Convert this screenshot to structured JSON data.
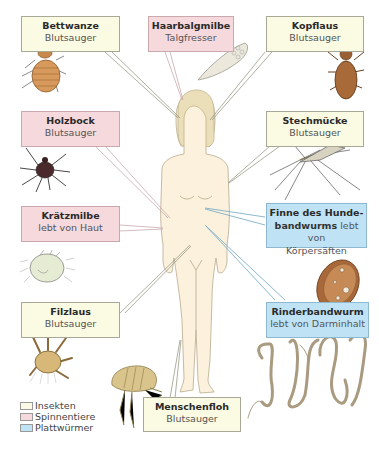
{
  "diagram": {
    "category_colors": {
      "insekten": "#fbfae2",
      "spinnentiere": "#f6d9dd",
      "plattwuermer": "#bfe3f5"
    },
    "parasites": [
      {
        "id": "bettwanze",
        "name": "Bettwanze",
        "role": "Blutsauger",
        "group": "insekten"
      },
      {
        "id": "haarbalgmilbe",
        "name": "Haarbalgmilbe",
        "role": "Talgfresser",
        "group": "spinnentiere"
      },
      {
        "id": "kopflaus",
        "name": "Kopflaus",
        "role": "Blutsauger",
        "group": "insekten"
      },
      {
        "id": "holzbock",
        "name": "Holzbock",
        "role": "Blutsauger",
        "group": "spinnentiere"
      },
      {
        "id": "stechmuecke",
        "name": "Stechmücke",
        "role": "Blutsauger",
        "group": "insekten"
      },
      {
        "id": "kraetzmilbe",
        "name": "Krätzmilbe",
        "role": "lebt von Haut",
        "group": "spinnentiere"
      },
      {
        "id": "finne",
        "name": "Finne des Hunde-bandwurms",
        "name_line1": "Finne des Hunde-",
        "name_line2": "bandwurms",
        "role": "lebt von Körpersäften",
        "role_inline": "lebt von",
        "role_line3": "Körpersäften",
        "group": "plattwuermer"
      },
      {
        "id": "filzlaus",
        "name": "Filzlaus",
        "role": "Blutsauger",
        "group": "insekten"
      },
      {
        "id": "rinderbandwurm",
        "name": "Rinderbandwurm",
        "role": "lebt von Darminhalt",
        "group": "plattwuermer"
      },
      {
        "id": "menschenfloh",
        "name": "Menschenfloh",
        "role": "Blutsauger",
        "group": "insekten"
      }
    ],
    "legend": [
      {
        "label": "Insekten",
        "color": "#fbfae2"
      },
      {
        "label": "Spinnentiere",
        "color": "#f6d9dd"
      },
      {
        "label": "Plattwürmer",
        "color": "#bfe3f5"
      }
    ]
  }
}
